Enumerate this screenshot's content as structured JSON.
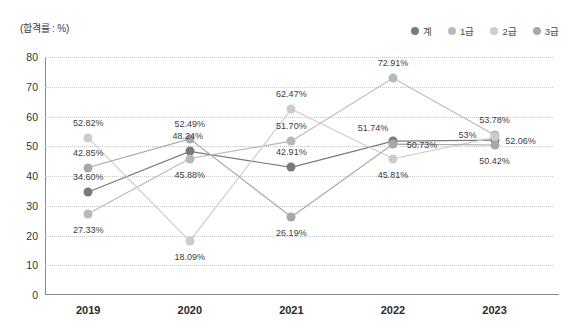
{
  "axis_note": "(합격률 : %)",
  "legend": {
    "items": [
      {
        "label": "계",
        "color": "#7a7a7a"
      },
      {
        "label": "1급",
        "color": "#b9b9b9"
      },
      {
        "label": "2급",
        "color": "#cccccc"
      },
      {
        "label": "3급",
        "color": "#a8a8a8"
      }
    ]
  },
  "chart_data": {
    "type": "line",
    "title": "",
    "xlabel": "",
    "ylabel": "합격률",
    "unit": "%",
    "axis_note": "(합격률 : %)",
    "categories": [
      "2019",
      "2020",
      "2021",
      "2022",
      "2023"
    ],
    "ylim": [
      0,
      80
    ],
    "yticks": [
      0,
      10,
      20,
      30,
      40,
      50,
      60,
      70,
      80
    ],
    "grid": true,
    "legend_position": "top-right",
    "series": [
      {
        "name": "계",
        "color": "#7a7a7a",
        "values": [
          34.6,
          48.24,
          42.91,
          51.74,
          52.06
        ],
        "labels": [
          "34.60%",
          "48.24%",
          "42.91%",
          "51.74%",
          "52.06%"
        ]
      },
      {
        "name": "1급",
        "color": "#b9b9b9",
        "values": [
          27.33,
          45.88,
          51.7,
          72.91,
          53.78
        ],
        "labels": [
          "27.33%",
          "45.88%",
          "51.70%",
          "72.91%",
          "53.78%"
        ]
      },
      {
        "name": "2급",
        "color": "#cccccc",
        "values": [
          52.82,
          18.09,
          62.47,
          45.81,
          53.0
        ],
        "labels": [
          "52.82%",
          "18.09%",
          "62.47%",
          "45.81%",
          "53%"
        ]
      },
      {
        "name": "3급",
        "color": "#a8a8a8",
        "values": [
          42.85,
          52.49,
          26.19,
          50.73,
          50.42
        ],
        "labels": [
          "42.85%",
          "52.49%",
          "26.19%",
          "50.73%",
          "50.42%"
        ]
      }
    ],
    "label_offsets": [
      [
        [
          0,
          -15
        ],
        [
          -2,
          -15
        ],
        [
          0,
          -15
        ],
        [
          -20,
          -13
        ],
        [
          26,
          1
        ]
      ],
      [
        [
          0,
          16
        ],
        [
          0,
          16
        ],
        [
          0,
          -15
        ],
        [
          0,
          -15
        ],
        [
          0,
          -15
        ]
      ],
      [
        [
          0,
          -15
        ],
        [
          0,
          16
        ],
        [
          0,
          -15
        ],
        [
          0,
          16
        ],
        [
          -27,
          -2
        ]
      ],
      [
        [
          0,
          -15
        ],
        [
          0,
          -15
        ],
        [
          0,
          16
        ],
        [
          29,
          1
        ],
        [
          0,
          16
        ]
      ]
    ]
  }
}
